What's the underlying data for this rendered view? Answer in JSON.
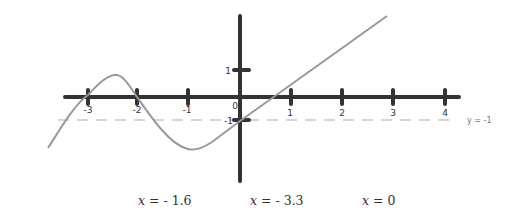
{
  "diagram": {
    "type": "function-graph",
    "x_axis": {
      "ticks": [
        {
          "value": -3,
          "label": "-3"
        },
        {
          "value": -2,
          "label": "-2"
        },
        {
          "value": -1,
          "label": "-1"
        },
        {
          "value": 1,
          "label": "1"
        },
        {
          "value": 2,
          "label": "2"
        },
        {
          "value": 3,
          "label": "3"
        },
        {
          "value": 4,
          "label": "4"
        }
      ]
    },
    "y_axis": {
      "ticks": [
        {
          "value": 1,
          "label": "1"
        },
        {
          "value": -1,
          "label": "-1"
        }
      ]
    },
    "origin_label": "0",
    "asymptote": {
      "label": "y = -1",
      "value": -1,
      "style": "dashed"
    },
    "curve": {
      "color": "#999999",
      "description": "Curve rising from lower left, crossing x-axis at x=-3, local max between -3 and -2, crossing at x=-2, local min near x=-0.9, then rising linearly through (0,-1) and crossing x-axis near x=0.7"
    },
    "axis_color": "#333333"
  },
  "answers": [
    {
      "var": "x",
      "text": " = - 1.6"
    },
    {
      "var": "x",
      "text": " = - 3.3"
    },
    {
      "var": "x",
      "text": " = 0"
    }
  ]
}
